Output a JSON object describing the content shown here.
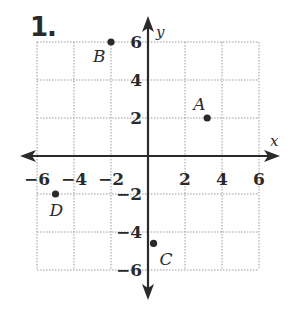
{
  "problem": {
    "number": "1."
  },
  "chart_data": {
    "type": "scatter",
    "title": "",
    "xlabel": "x",
    "ylabel": "y",
    "xlim": [
      -6,
      6
    ],
    "ylim": [
      -6,
      6
    ],
    "grid": true,
    "grid_step": 2,
    "x_ticks": [
      -6,
      -4,
      -2,
      2,
      4,
      6
    ],
    "y_ticks": [
      6,
      4,
      2,
      -2,
      -4,
      -6
    ],
    "x_tick_labels": [
      "−6",
      "−4",
      "−2",
      "2",
      "4",
      "6"
    ],
    "y_tick_labels": [
      "6",
      "4",
      "2",
      "−2",
      "−4",
      "−6"
    ],
    "points": [
      {
        "label": "A",
        "x": 3.2,
        "y": 2
      },
      {
        "label": "B",
        "x": -2,
        "y": 6
      },
      {
        "label": "C",
        "x": 0.3,
        "y": -4.6
      },
      {
        "label": "D",
        "x": -5,
        "y": -2
      }
    ],
    "legend": null
  },
  "colors": {
    "ink": "#2a2a2a",
    "grid": "#9a9a9a",
    "background": "#ffffff"
  }
}
